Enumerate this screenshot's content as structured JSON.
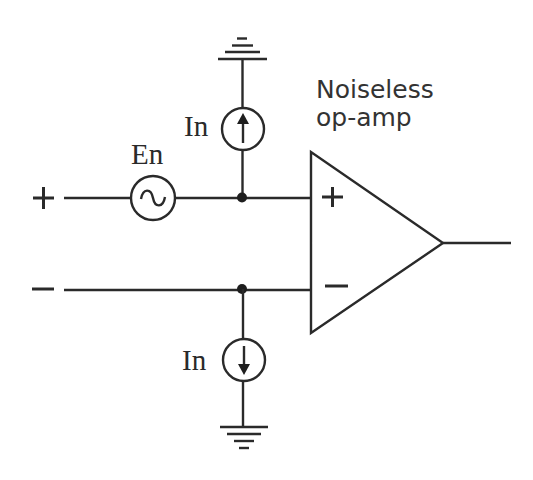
{
  "diagram": {
    "title_line1": "Noiseless",
    "title_line2": "op-amp",
    "labels": {
      "voltage_noise": "En",
      "current_noise_top": "In",
      "current_noise_bottom": "In"
    },
    "terminals": {
      "noninverting_input": "+",
      "inverting_input": "−"
    },
    "opamp_inputs": {
      "plus": "+",
      "minus": "−"
    },
    "components": [
      {
        "type": "voltage-source-ac",
        "label": "En",
        "position": "series on + input"
      },
      {
        "type": "current-source",
        "label": "In",
        "direction": "up",
        "position": "+ input node to ground"
      },
      {
        "type": "current-source",
        "label": "In",
        "direction": "down",
        "position": "− input node to ground"
      },
      {
        "type": "op-amp",
        "label": "Noiseless op-amp"
      },
      {
        "type": "ground",
        "count": 2
      }
    ],
    "colors": {
      "stroke": "#2a2a2a",
      "background": "#ffffff"
    }
  }
}
